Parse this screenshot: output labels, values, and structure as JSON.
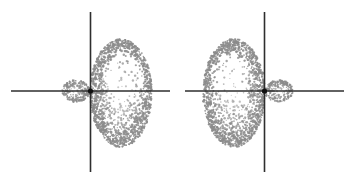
{
  "figure": {
    "background_color": "#ffffff",
    "width": 354,
    "height": 179,
    "axis_color": "#2e2e2e",
    "nucleus_color": "#111111",
    "stipple_color": "#8c8c8c",
    "orbitals": [
      {
        "name": "sp-hybrid-orbital-left",
        "nucleus": {
          "x": 90.5,
          "y": 91,
          "radius": 2.6
        },
        "vertical_axis": {
          "x": 90.5,
          "y1": 12,
          "y2": 172
        },
        "horizontal_axis": {
          "y": 91,
          "x1": 11,
          "x2": 170
        },
        "major_lobe": {
          "name": "major-lobe",
          "direction": "right",
          "cx": 121,
          "cy": 93,
          "rx": 31,
          "ry": 54,
          "flat_edge_x": 90.5,
          "dot_count": 1500
        },
        "minor_lobe": {
          "name": "minor-lobe",
          "direction": "left",
          "cx": 76,
          "cy": 91,
          "rx": 14,
          "ry": 11,
          "dot_count": 260
        }
      },
      {
        "name": "sp-hybrid-orbital-right",
        "nucleus": {
          "x": 264.5,
          "y": 91,
          "radius": 2.6
        },
        "vertical_axis": {
          "x": 264.5,
          "y1": 12,
          "y2": 172
        },
        "horizontal_axis": {
          "y": 91,
          "x1": 185,
          "x2": 344
        },
        "major_lobe": {
          "name": "major-lobe",
          "direction": "left",
          "cx": 234,
          "cy": 93,
          "rx": 31,
          "ry": 54,
          "flat_edge_x": 264.5,
          "dot_count": 1500
        },
        "minor_lobe": {
          "name": "minor-lobe",
          "direction": "right",
          "cx": 279,
          "cy": 91,
          "rx": 14,
          "ry": 11,
          "dot_count": 260
        }
      }
    ]
  }
}
